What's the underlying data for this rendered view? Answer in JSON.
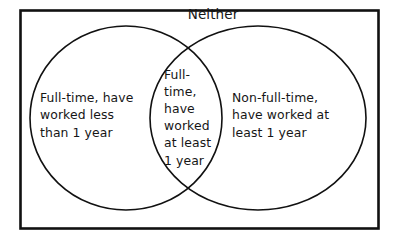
{
  "diagram": {
    "type": "venn",
    "title": "",
    "background_color": "#ffffff",
    "stroke_color": "#111111",
    "text_color": "#161616",
    "universe": {
      "label": "Neither",
      "shape": "rectangle",
      "description": "Outer rectangle representing people who are neither full-time nor have worked at least 1 year"
    },
    "regions": {
      "left_only": {
        "label": "Full-time, have\nworked less\nthan 1 year",
        "lines": [
          "Full-time, have",
          "worked less",
          "than 1 year"
        ]
      },
      "intersection": {
        "label": "Full-\ntime,\nhave\nworked\nat least\n1 year",
        "lines": [
          "Full-",
          "time,",
          "have",
          "worked",
          "at least",
          "1 year"
        ]
      },
      "right_only": {
        "label": "Non-full-time,\nhave worked at\nleast 1 year",
        "lines": [
          "Non-full-time,",
          "have worked at",
          "least 1 year"
        ]
      }
    },
    "sets": [
      {
        "name": "left-set",
        "cx": 126,
        "cy": 118,
        "rx": 96,
        "ry": 92
      },
      {
        "name": "right-set",
        "cx": 258,
        "cy": 118,
        "rx": 108,
        "ry": 92
      }
    ],
    "frame": {
      "x": 20,
      "y": 10,
      "width": 358,
      "height": 218
    }
  }
}
